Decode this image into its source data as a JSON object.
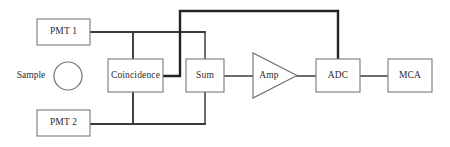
{
  "diagram": {
    "background_color": "#ffffff",
    "line_color": "#4a4a4a",
    "box_stroke_color": "#7a7a7a",
    "text_color": "#2b2b2b",
    "nodes": [
      {
        "id": "pmt1",
        "label": "PMT 1",
        "shape": "rect",
        "x": 37,
        "y": 19,
        "w": 53,
        "h": 26,
        "cx": 63.5,
        "cy": 32
      },
      {
        "id": "sample_label",
        "label": "Sample",
        "shape": "text",
        "cx": 31,
        "cy": 76
      },
      {
        "id": "sample_circle",
        "label": "",
        "shape": "circle",
        "cx": 68,
        "cy": 76,
        "r": 14
      },
      {
        "id": "pmt2",
        "label": "PMT 2",
        "shape": "rect",
        "x": 37,
        "y": 110,
        "w": 53,
        "h": 26,
        "cx": 63.5,
        "cy": 123
      },
      {
        "id": "coincidence",
        "label": "Coincidence",
        "shape": "rect",
        "x": 108,
        "y": 59,
        "w": 55,
        "h": 33,
        "cx": 135.5,
        "cy": 75.5
      },
      {
        "id": "sum",
        "label": "Sum",
        "shape": "rect",
        "x": 186,
        "y": 59,
        "w": 38,
        "h": 33,
        "cx": 205,
        "cy": 75.5
      },
      {
        "id": "amp",
        "label": "Amp",
        "shape": "triangle",
        "x": 253,
        "y": 53,
        "w": 44,
        "h": 45,
        "cx": 269,
        "cy": 75.5
      },
      {
        "id": "adc",
        "label": "ADC",
        "shape": "rect",
        "x": 316,
        "y": 59,
        "w": 44,
        "h": 33,
        "cx": 338,
        "cy": 75.5
      },
      {
        "id": "mca",
        "label": "MCA",
        "shape": "rect",
        "x": 388,
        "y": 59,
        "w": 44,
        "h": 33,
        "cx": 410,
        "cy": 75.5
      }
    ],
    "connections": [
      {
        "id": "pmt1-bus",
        "from": "pmt1",
        "to": "bus-top",
        "path": "M 90 32 L 205 32",
        "weight": "med"
      },
      {
        "id": "pmt1-coincidence",
        "from": "pmt1",
        "to": "coincidence",
        "path": "M 133 32 L 133 59",
        "weight": "med"
      },
      {
        "id": "pmt1-sum",
        "from": "pmt1",
        "to": "sum",
        "path": "M 205 32 L 205 59",
        "weight": "thin"
      },
      {
        "id": "coincidence-gate",
        "from": "coincidence",
        "to": "adc",
        "path": "M 163 76 L 180 76 L 180 11 L 338 11 L 338 59",
        "weight": "thick"
      },
      {
        "id": "sum-amp",
        "from": "sum",
        "to": "amp",
        "path": "M 224 76 L 253 76",
        "weight": "thin"
      },
      {
        "id": "amp-adc",
        "from": "amp",
        "to": "adc",
        "path": "M 297 76 L 316 76",
        "weight": "thin"
      },
      {
        "id": "adc-mca",
        "from": "adc",
        "to": "mca",
        "path": "M 360 76 L 388 76",
        "weight": "thin"
      },
      {
        "id": "pmt2-bus",
        "from": "pmt2",
        "to": "bus-bottom",
        "path": "M 90 124 L 205 124",
        "weight": "med"
      },
      {
        "id": "pmt2-coincidence",
        "from": "pmt2",
        "to": "coincidence",
        "path": "M 133 124 L 133 92",
        "weight": "med"
      },
      {
        "id": "pmt2-sum",
        "from": "pmt2",
        "to": "sum",
        "path": "M 205 124 L 205 92",
        "weight": "thin"
      }
    ]
  }
}
